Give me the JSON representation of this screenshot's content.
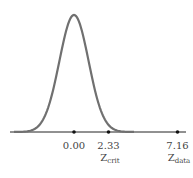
{
  "chart_data": {
    "type": "line",
    "title": "",
    "x_ticks": [
      {
        "value": 0.0,
        "label": "0.00",
        "name": ""
      },
      {
        "value": 2.33,
        "label": "2.33",
        "name": "Z",
        "sub": "crit"
      },
      {
        "value": 7.16,
        "label": "7.16",
        "name": "Z",
        "sub": "data"
      }
    ],
    "curve": "standard normal density",
    "colors": {
      "curve": "#707070",
      "axis": "#222222"
    }
  },
  "labels": {
    "t0": "0.00",
    "t1": "2.33",
    "t1_name": "Z",
    "t1_sub": "crit",
    "t2": "7.16",
    "t2_name": "Z",
    "t2_sub": "data"
  }
}
